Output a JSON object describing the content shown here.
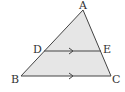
{
  "diagram": {
    "fill_color": "#e6e6e6",
    "stroke_color": "#444444",
    "points": {
      "A": {
        "label": "A",
        "x": 83,
        "y": 10
      },
      "B": {
        "label": "B",
        "x": 21,
        "y": 76
      },
      "C": {
        "label": "C",
        "x": 111,
        "y": 76
      },
      "D": {
        "label": "D",
        "x": 44,
        "y": 51
      },
      "E": {
        "label": "E",
        "x": 101,
        "y": 51
      }
    },
    "segments": [
      "AB",
      "BC",
      "CA",
      "DE"
    ],
    "parallel_marks": [
      "DE",
      "BC"
    ]
  }
}
